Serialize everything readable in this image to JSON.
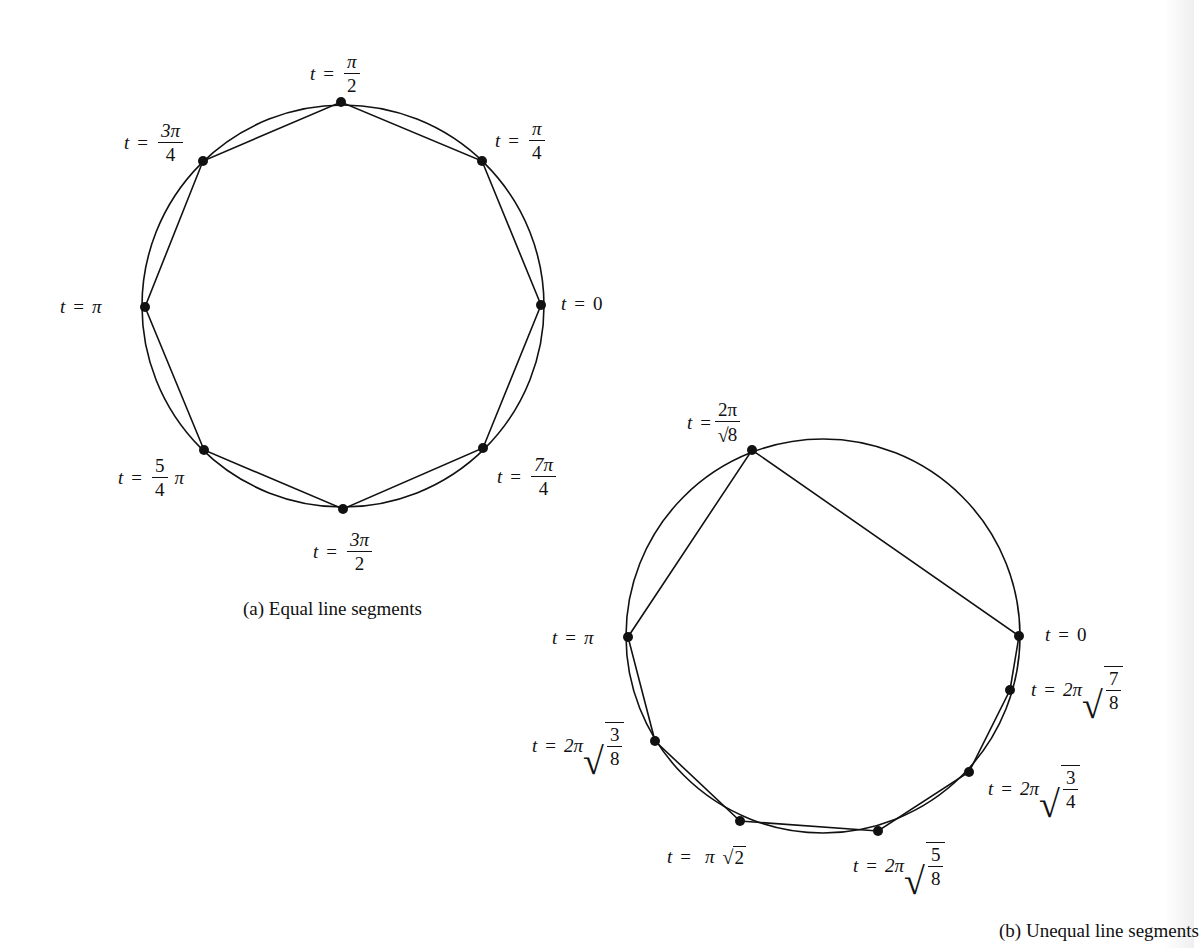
{
  "figure_a": {
    "caption": "(a) Equal line segments",
    "circle": {
      "cx": 343,
      "cy": 306,
      "r": 201
    },
    "points": [
      {
        "id": "t0",
        "x": 541,
        "y": 305
      },
      {
        "id": "pi4",
        "x": 482,
        "y": 161
      },
      {
        "id": "pi2",
        "x": 341,
        "y": 102
      },
      {
        "id": "3pi4",
        "x": 203,
        "y": 161
      },
      {
        "id": "pi",
        "x": 145,
        "y": 307
      },
      {
        "id": "5pi4",
        "x": 204,
        "y": 450
      },
      {
        "id": "3pi2",
        "x": 343,
        "y": 509
      },
      {
        "id": "7pi4",
        "x": 483,
        "y": 448
      }
    ],
    "labels": {
      "t": "t",
      "eq": "=",
      "pi": "π",
      "zero": "0",
      "pi2_num": "π",
      "pi2_den": "2",
      "pi4_num": "π",
      "pi4_den": "4",
      "3pi4_num": "3π",
      "3pi4_den": "4",
      "5pi4_num": "5",
      "5pi4_den": "4",
      "5pi4_suffix": "π",
      "3pi2_num": "3π",
      "3pi2_den": "2",
      "7pi4_num": "7π",
      "7pi4_den": "4"
    }
  },
  "figure_b": {
    "caption": "(b) Unequal line segments",
    "circle": {
      "cx": 823,
      "cy": 636,
      "r": 197
    },
    "points": [
      {
        "id": "t0",
        "x": 1019,
        "y": 636
      },
      {
        "id": "2pi_rt8",
        "x": 752,
        "y": 450
      },
      {
        "id": "pi",
        "x": 628,
        "y": 637
      },
      {
        "id": "2pi_rt3_8",
        "x": 655,
        "y": 741
      },
      {
        "id": "pi_rt2",
        "x": 740,
        "y": 821
      },
      {
        "id": "2pi_rt5_8",
        "x": 878,
        "y": 831
      },
      {
        "id": "2pi_rt3_4",
        "x": 969,
        "y": 772
      },
      {
        "id": "2pi_rt7_8",
        "x": 1010,
        "y": 690
      }
    ],
    "labels": {
      "t": "t",
      "eq": "=",
      "pi": "π",
      "zero": "0",
      "two_pi": "2π",
      "rt8_num": "2π",
      "rt8_den": "8",
      "rt3_8_num": "3",
      "rt3_8_den": "8",
      "rt2": "2",
      "rt5_8_num": "5",
      "rt5_8_den": "8",
      "rt3_4_num": "3",
      "rt3_4_den": "4",
      "rt7_8_num": "7",
      "rt7_8_den": "8",
      "radical": "√"
    }
  },
  "style": {
    "ink": "#111111",
    "background": "#ffffff"
  }
}
